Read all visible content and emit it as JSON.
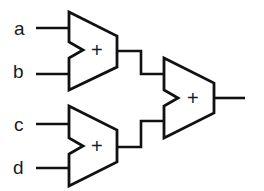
{
  "diagram": {
    "type": "adder-tree",
    "inputs": [
      {
        "id": "a",
        "label": "a"
      },
      {
        "id": "b",
        "label": "b"
      },
      {
        "id": "c",
        "label": "c"
      },
      {
        "id": "d",
        "label": "d"
      }
    ],
    "adders": [
      {
        "id": "adder-1",
        "symbol": "+",
        "inputs": [
          "a",
          "b"
        ]
      },
      {
        "id": "adder-2",
        "symbol": "+",
        "inputs": [
          "c",
          "d"
        ]
      },
      {
        "id": "adder-3",
        "symbol": "+",
        "inputs": [
          "adder-1",
          "adder-2"
        ]
      }
    ],
    "colors": {
      "stroke": "#111111",
      "background": "#ffffff"
    }
  }
}
